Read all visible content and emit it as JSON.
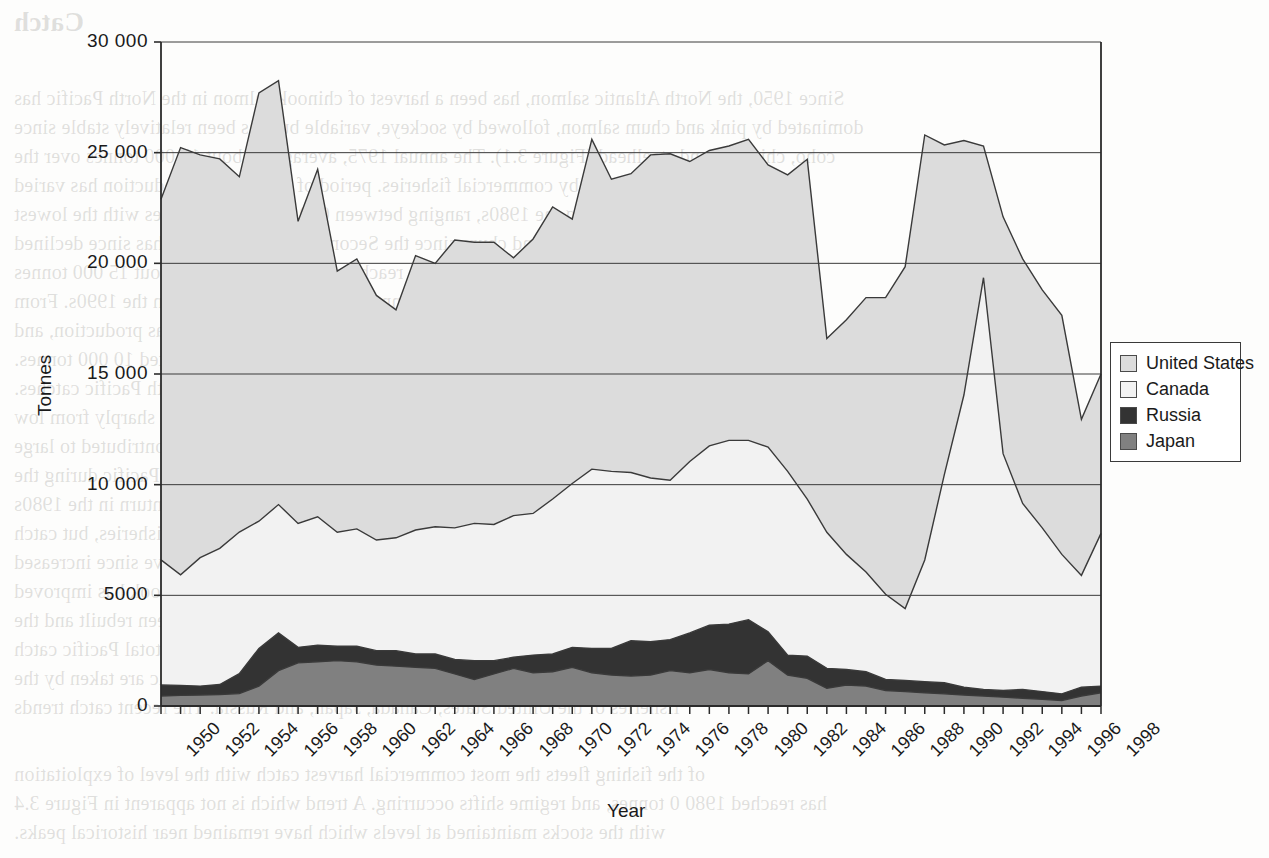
{
  "figure": {
    "background_color": "#fdfdfc",
    "plot_border_color": "#3a3a3a"
  },
  "axis": {
    "y_title": "Tonnes",
    "x_title": "Year",
    "y_ticks": [
      "30 000",
      "25 000",
      "20 000",
      "15 000",
      "10 000",
      "5000",
      "0"
    ],
    "x_ticks": [
      "1950",
      "1952",
      "1954",
      "1956",
      "1958",
      "1960",
      "1962",
      "1964",
      "1966",
      "1968",
      "1970",
      "1972",
      "1974",
      "1976",
      "1978",
      "1980",
      "1982",
      "1984",
      "1986",
      "1988",
      "1990",
      "1992",
      "1994",
      "1996",
      "1998"
    ]
  },
  "legend": {
    "entries": [
      {
        "label": "United States",
        "color": "#DCDCDC"
      },
      {
        "label": "Canada",
        "color": "#F2F2F2"
      },
      {
        "label": "Russia",
        "color": "#333333"
      },
      {
        "label": "Japan",
        "color": "#808080"
      }
    ]
  },
  "bleed_text": {
    "lines": [
      {
        "x": 14,
        "y": 8,
        "size": 27,
        "bold": true,
        "text": "Catch"
      },
      {
        "x": 14,
        "y": 84,
        "size": 20,
        "bold": false,
        "text": "Since 1950, the North Atlantic salmon, has been a harvest of chinook salmon in the North Pacific has"
      },
      {
        "x": 14,
        "y": 113,
        "size": 20,
        "bold": false,
        "text": "dominated by pink and chum salmon, followed by sockeye, variable but has been relatively stable since"
      },
      {
        "x": 14,
        "y": 142,
        "size": 20,
        "bold": false,
        "text": "coho, chinook, and steelhead (Figure 3.1). The annual 1975, averaging about 15 000 tonnes over the"
      },
      {
        "x": 14,
        "y": 171,
        "size": 20,
        "bold": false,
        "text": "Most salmon are used by commercial fisheries. period of years. Total production has varied"
      },
      {
        "x": 14,
        "y": 200,
        "size": 20,
        "bold": false,
        "text": "only at low and much during the 1980s, ranging between 000 and 10 000 tonnes with the lowest"
      },
      {
        "x": 14,
        "y": 229,
        "size": 20,
        "bold": false,
        "text": "and highest catches of pink and chum since the Second World War. Catch has since declined"
      },
      {
        "x": 14,
        "y": 258,
        "size": 20,
        "bold": false,
        "text": "per year of more than 15 000 tonnes in 1990s, reaching an annual total of about 15 000 tonnes"
      },
      {
        "x": 14,
        "y": 287,
        "size": 20,
        "bold": false,
        "text": "Pacific salmon catches reached nearly 1000 000 tonnes during the peak period in the 1990s. From"
      },
      {
        "x": 14,
        "y": 316,
        "size": 20,
        "bold": false,
        "text": "annual harvests of about 1960s and 1970s, 1000 tonnes. Expanded high-seas production, and"
      },
      {
        "x": 14,
        "y": 345,
        "size": 20,
        "bold": false,
        "text": "catch statistics through 1998 and the average annual catch was an estimated 10 000 tonnes."
      },
      {
        "x": 14,
        "y": 374,
        "size": 20,
        "bold": false,
        "text": "catch of the total of 15 000 to 20 000 tonnes in North Pacific catches."
      },
      {
        "x": 14,
        "y": 403,
        "size": 20,
        "bold": false,
        "text": "There are no landings in harvests. Commercial salmon catches expanded sharply from low"
      },
      {
        "x": 14,
        "y": 432,
        "size": 20,
        "bold": false,
        "text": "levels in many parts of the North Pacific. Moreover, since they contributed to large"
      },
      {
        "x": 14,
        "y": 461,
        "size": 20,
        "bold": false,
        "text": "harvest fluctuations of the most important species in the North Pacific during the"
      },
      {
        "x": 14,
        "y": 490,
        "size": 20,
        "bold": false,
        "text": "three decades from the 1950s to the 1970s. During 1985 the downturn in the 1980s"
      },
      {
        "x": 14,
        "y": 519,
        "size": 20,
        "bold": false,
        "text": "sustained declines of the stocks harvest some of the fisheries, but catch"
      },
      {
        "x": 14,
        "y": 548,
        "size": 20,
        "bold": false,
        "text": "levels and early salmon catching in the Pacific ocean and have since increased"
      },
      {
        "x": 14,
        "y": 577,
        "size": 20,
        "bold": false,
        "text": "in 1990s during it has passively profited from the harvests of chinook has improved"
      },
      {
        "x": 14,
        "y": 606,
        "size": 20,
        "bold": false,
        "text": "abundant species, salmon stocks in this region to have been rebuilt and the"
      },
      {
        "x": 14,
        "y": 635,
        "size": 20,
        "bold": false,
        "text": "catch has generally been near 1970s for a larger part of the total Pacific catch"
      },
      {
        "x": 14,
        "y": 664,
        "size": 20,
        "bold": false,
        "text": "over the past decade. Most of the catches in the North Pacific are taken by the"
      },
      {
        "x": 14,
        "y": 693,
        "size": 20,
        "bold": false,
        "text": "fisheries of the United States, Canada, Japan, and Russia. The recent catch trends"
      },
      {
        "x": 14,
        "y": 760,
        "size": 20,
        "bold": false,
        "text": "of the fishing fleets the most commercial harvest catch with the level of exploitation"
      },
      {
        "x": 14,
        "y": 789,
        "size": 20,
        "bold": false,
        "text": "has reached 1980 0 tonnes, and regime shifts occurring. A trend which is not apparent in Figure 3.4"
      },
      {
        "x": 14,
        "y": 818,
        "size": 20,
        "bold": false,
        "text": "with the stocks maintained at levels which have remained near historical peaks."
      }
    ]
  },
  "chart_data": {
    "type": "area",
    "stacked": true,
    "title": "",
    "xlabel": "Year",
    "ylabel": "Tonnes",
    "xlim": [
      1950,
      1998
    ],
    "ylim": [
      0,
      30000
    ],
    "grid": "horizontal-gridlines-at-y-ticks",
    "legend_position": "right-middle",
    "x": [
      1950,
      1951,
      1952,
      1953,
      1954,
      1955,
      1956,
      1957,
      1958,
      1959,
      1960,
      1961,
      1962,
      1963,
      1964,
      1965,
      1966,
      1967,
      1968,
      1969,
      1970,
      1971,
      1972,
      1973,
      1974,
      1975,
      1976,
      1977,
      1978,
      1979,
      1980,
      1981,
      1982,
      1983,
      1984,
      1985,
      1986,
      1987,
      1988,
      1989,
      1990,
      1991,
      1992,
      1993,
      1994,
      1995,
      1996,
      1997,
      1998
    ],
    "series": [
      {
        "name": "Japan",
        "color": "#808080",
        "stack_order": 1,
        "values": [
          450,
          480,
          500,
          520,
          560,
          900,
          1600,
          1950,
          2000,
          2050,
          2000,
          1850,
          1800,
          1750,
          1700,
          1450,
          1200,
          1450,
          1700,
          1500,
          1550,
          1750,
          1500,
          1400,
          1350,
          1400,
          1600,
          1500,
          1650,
          1500,
          1450,
          2050,
          1400,
          1250,
          800,
          950,
          900,
          700,
          650,
          600,
          550,
          500,
          450,
          400,
          350,
          300,
          250,
          450,
          600
        ]
      },
      {
        "name": "Russia",
        "color": "#333333",
        "stack_order": 2,
        "values": [
          500,
          450,
          400,
          450,
          900,
          1700,
          1700,
          700,
          750,
          650,
          700,
          650,
          700,
          600,
          650,
          650,
          850,
          600,
          500,
          800,
          800,
          900,
          1100,
          1200,
          1600,
          1500,
          1400,
          1800,
          2000,
          2200,
          2450,
          1300,
          900,
          1000,
          900,
          700,
          650,
          500,
          500,
          500,
          500,
          350,
          300,
          300,
          400,
          350,
          300,
          400,
          300
        ]
      },
      {
        "name": "Canada",
        "color": "#F2F2F2",
        "stack_order": 3,
        "values": [
          5650,
          5000,
          5800,
          6150,
          6400,
          5750,
          5800,
          5600,
          5800,
          5150,
          5300,
          5000,
          5100,
          5600,
          5750,
          5950,
          6200,
          6150,
          6400,
          6400,
          7000,
          7400,
          8100,
          8000,
          7600,
          7400,
          7200,
          7750,
          8100,
          8300,
          8100,
          8350,
          8300,
          7100,
          6150,
          5200,
          4500,
          3850,
          3250,
          5500,
          9400,
          13200,
          18600,
          10700,
          8400,
          7400,
          6300,
          5050,
          6900
        ]
      },
      {
        "name": "United States",
        "color": "#DCDCDC",
        "stack_order": 4,
        "values": [
          16300,
          19300,
          18200,
          17600,
          16050,
          19350,
          19150,
          13650,
          15700,
          11800,
          12200,
          11050,
          10300,
          12400,
          11900,
          13000,
          12700,
          12750,
          11650,
          12400,
          13200,
          11950,
          14900,
          13200,
          13500,
          14600,
          14750,
          13550,
          13350,
          13300,
          13600,
          12750,
          13400,
          15350,
          8750,
          10600,
          12400,
          13400,
          15450,
          19200,
          14900,
          11500,
          5950,
          10700,
          11050,
          10750,
          10800,
          7050,
          7200
        ]
      }
    ],
    "totals": [
      22900,
      25230,
      24900,
      24720,
      23910,
      27700,
      28250,
      21900,
      24250,
      19650,
      20200,
      18550,
      17900,
      20350,
      20000,
      21050,
      20950,
      20950,
      20250,
      21100,
      22550,
      22000,
      25600,
      23800,
      24050,
      24900,
      24950,
      24600,
      25100,
      25300,
      25600,
      24450,
      24000,
      24700,
      16600,
      17450,
      18450,
      18450,
      19850,
      25800,
      25350,
      25550,
      25300,
      22100,
      20200,
      18800,
      17650,
      12950,
      15000
    ]
  },
  "geometry": {
    "plot_left": 161,
    "plot_right": 1101,
    "plot_top": 42,
    "plot_bottom": 706
  }
}
